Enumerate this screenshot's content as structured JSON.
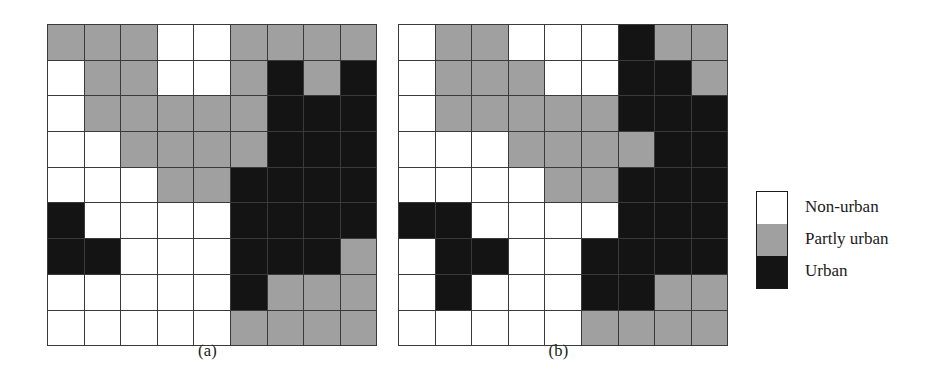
{
  "figure": {
    "title": "",
    "colors": {
      "non_urban": "#ffffff",
      "partly_urban": "#a0a0a0",
      "urban": "#141414",
      "grid_line": "#3a3a3a",
      "text": "#1a1a1a",
      "background": "#ffffff"
    }
  },
  "panels": [
    {
      "id": "a",
      "caption": "(a)",
      "rows": 9,
      "cols": 9,
      "cells": [
        [
          "partly",
          "partly",
          "partly",
          "nonurban",
          "nonurban",
          "partly",
          "partly",
          "partly",
          "partly"
        ],
        [
          "nonurban",
          "partly",
          "partly",
          "nonurban",
          "nonurban",
          "partly",
          "urban",
          "partly",
          "urban"
        ],
        [
          "nonurban",
          "partly",
          "partly",
          "partly",
          "partly",
          "partly",
          "urban",
          "urban",
          "urban"
        ],
        [
          "nonurban",
          "nonurban",
          "partly",
          "partly",
          "partly",
          "partly",
          "urban",
          "urban",
          "urban"
        ],
        [
          "nonurban",
          "nonurban",
          "nonurban",
          "partly",
          "partly",
          "urban",
          "urban",
          "urban",
          "urban"
        ],
        [
          "urban",
          "nonurban",
          "nonurban",
          "nonurban",
          "nonurban",
          "urban",
          "urban",
          "urban",
          "urban"
        ],
        [
          "urban",
          "urban",
          "nonurban",
          "nonurban",
          "nonurban",
          "urban",
          "urban",
          "urban",
          "partly"
        ],
        [
          "nonurban",
          "nonurban",
          "nonurban",
          "nonurban",
          "nonurban",
          "urban",
          "partly",
          "partly",
          "partly"
        ],
        [
          "nonurban",
          "nonurban",
          "nonurban",
          "nonurban",
          "nonurban",
          "partly",
          "partly",
          "partly",
          "partly"
        ]
      ]
    },
    {
      "id": "b",
      "caption": "(b)",
      "rows": 9,
      "cols": 9,
      "cells": [
        [
          "nonurban",
          "partly",
          "partly",
          "nonurban",
          "nonurban",
          "nonurban",
          "urban",
          "partly",
          "partly"
        ],
        [
          "nonurban",
          "partly",
          "partly",
          "partly",
          "nonurban",
          "nonurban",
          "urban",
          "urban",
          "partly"
        ],
        [
          "nonurban",
          "partly",
          "partly",
          "partly",
          "partly",
          "partly",
          "urban",
          "urban",
          "urban"
        ],
        [
          "nonurban",
          "nonurban",
          "nonurban",
          "partly",
          "partly",
          "partly",
          "partly",
          "urban",
          "urban"
        ],
        [
          "nonurban",
          "nonurban",
          "nonurban",
          "nonurban",
          "partly",
          "partly",
          "urban",
          "urban",
          "urban"
        ],
        [
          "urban",
          "urban",
          "nonurban",
          "nonurban",
          "nonurban",
          "nonurban",
          "urban",
          "urban",
          "urban"
        ],
        [
          "nonurban",
          "urban",
          "urban",
          "nonurban",
          "nonurban",
          "urban",
          "urban",
          "urban",
          "urban"
        ],
        [
          "nonurban",
          "urban",
          "nonurban",
          "nonurban",
          "nonurban",
          "urban",
          "urban",
          "partly",
          "partly"
        ],
        [
          "nonurban",
          "nonurban",
          "nonurban",
          "nonurban",
          "nonurban",
          "partly",
          "partly",
          "partly",
          "partly"
        ]
      ]
    }
  ],
  "legend": {
    "entries": [
      {
        "key": "nonurban",
        "label": "Non-urban"
      },
      {
        "key": "partly",
        "label": "Partly urban"
      },
      {
        "key": "urban",
        "label": "Urban"
      }
    ]
  },
  "chart_data": {
    "type": "heatmap",
    "title": "",
    "subtitle": "",
    "xlabel": "",
    "ylabel": "",
    "grid": true,
    "legend_position": "right",
    "category_labels": [
      "Non-urban",
      "Partly urban",
      "Urban"
    ],
    "category_values": [
      0,
      1,
      2
    ],
    "category_colors": [
      "#ffffff",
      "#a0a0a0",
      "#141414"
    ],
    "panels": [
      {
        "name": "(a)",
        "nrows": 9,
        "ncols": 9,
        "values": [
          [
            1,
            1,
            1,
            0,
            0,
            1,
            1,
            1,
            1
          ],
          [
            0,
            1,
            1,
            0,
            0,
            1,
            2,
            1,
            2
          ],
          [
            0,
            1,
            1,
            1,
            1,
            1,
            2,
            2,
            2
          ],
          [
            0,
            0,
            1,
            1,
            1,
            1,
            2,
            2,
            2
          ],
          [
            0,
            0,
            0,
            1,
            1,
            2,
            2,
            2,
            2
          ],
          [
            2,
            0,
            0,
            0,
            0,
            2,
            2,
            2,
            2
          ],
          [
            2,
            2,
            0,
            0,
            0,
            2,
            2,
            2,
            1
          ],
          [
            0,
            0,
            0,
            0,
            0,
            2,
            1,
            1,
            1
          ],
          [
            0,
            0,
            0,
            0,
            0,
            1,
            1,
            1,
            1
          ]
        ],
        "counts": {
          "non_urban": 33,
          "partly_urban": 26,
          "urban": 22
        }
      },
      {
        "name": "(b)",
        "nrows": 9,
        "ncols": 9,
        "values": [
          [
            0,
            1,
            1,
            0,
            0,
            0,
            2,
            1,
            1
          ],
          [
            0,
            1,
            1,
            1,
            0,
            0,
            2,
            2,
            1
          ],
          [
            0,
            1,
            1,
            1,
            1,
            1,
            2,
            2,
            2
          ],
          [
            0,
            0,
            0,
            1,
            1,
            1,
            1,
            2,
            2
          ],
          [
            0,
            0,
            0,
            0,
            1,
            1,
            2,
            2,
            2
          ],
          [
            2,
            2,
            0,
            0,
            0,
            0,
            2,
            2,
            2
          ],
          [
            0,
            2,
            2,
            0,
            0,
            2,
            2,
            2,
            2
          ],
          [
            0,
            2,
            0,
            0,
            0,
            2,
            2,
            1,
            1
          ],
          [
            0,
            0,
            0,
            0,
            0,
            1,
            1,
            1,
            1
          ]
        ],
        "counts": {
          "non_urban": 35,
          "partly_urban": 22,
          "urban": 24
        }
      }
    ]
  }
}
